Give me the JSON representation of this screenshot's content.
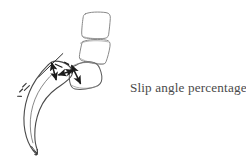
{
  "figure": {
    "caption": "Slip angle percentage",
    "background_color": "#ffffff",
    "caption_color": "#4a4a4a",
    "stroke_color_outline": "#7c7c7c",
    "stroke_color_bold": "#1b1b1b",
    "type": "hand-drawn line diagram"
  },
  "labels": {
    "vertebra_upper": "upper lumbar vertebral body",
    "vertebra_middle": "lower lumbar vertebral body",
    "vertebra_slipped": "slipped vertebral body",
    "sacrum": "sacrum",
    "measure_vertical": "vertical slip measurement arrow",
    "measure_horizontal": "horizontal slip measurement arrow",
    "measure_diagonal": "slipped body displacement arrow",
    "reference_line": "sacral endplate reference line",
    "hatch_marks": "posterior sacral hatch marks"
  }
}
